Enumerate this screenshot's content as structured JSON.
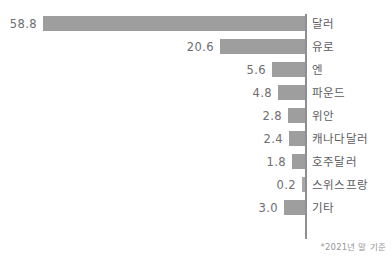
{
  "header": {
    "clipped_text": "",
    "footnote": "*2021년 말 기준"
  },
  "chart_data": {
    "type": "bar",
    "orientation": "horizontal",
    "title": "",
    "subtitle": "",
    "xlabel": "",
    "ylabel": "",
    "unit": "%",
    "grid": false,
    "legend": "none",
    "axis_baseline_side": "right",
    "note": "*2021년 말 기준",
    "bar_color": "#9e9e9e",
    "value_text_color": "#6d6d72",
    "label_text_color": "#5c5c61",
    "categories": [
      "달러",
      "유로",
      "엔",
      "파운드",
      "위안",
      "캐나다달러",
      "호주달러",
      "스위스프랑",
      "기타"
    ],
    "values": [
      58.8,
      20.6,
      5.6,
      4.8,
      2.8,
      2.4,
      1.8,
      0.2,
      3.0
    ],
    "value_labels": [
      "58.8",
      "20.6",
      "5.6",
      "4.8",
      "2.8",
      "2.4",
      "1.8",
      "0.2",
      "3.0"
    ],
    "bar_pixel_widths": [
      262,
      85,
      33,
      27,
      17,
      16,
      13,
      3,
      21
    ],
    "xlim": [
      0,
      58.8
    ]
  }
}
